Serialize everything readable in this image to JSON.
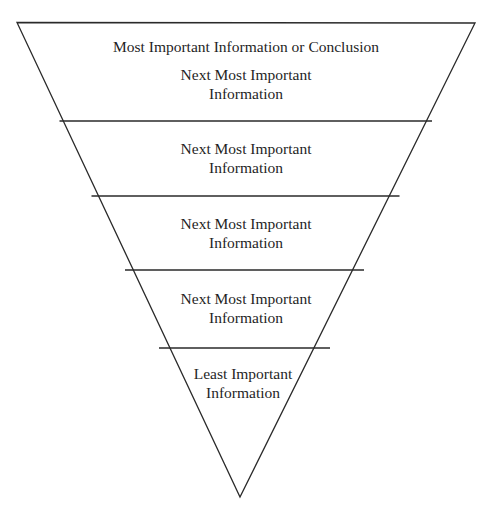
{
  "diagram": {
    "shape": "inverted-triangle",
    "stroke_color": "#2a2a2a",
    "text_color": "#1f1f1f",
    "background": "#ffffff",
    "levels": [
      {
        "rank": 1,
        "lines": [
          "Most Important Information or Conclusion",
          "Next Most Important",
          "Information"
        ]
      },
      {
        "rank": 2,
        "lines": [
          "Next Most Important",
          "Information"
        ]
      },
      {
        "rank": 3,
        "lines": [
          "Next Most Important",
          "Information"
        ]
      },
      {
        "rank": 4,
        "lines": [
          "Next Most Important",
          "Information"
        ]
      },
      {
        "rank": 5,
        "lines": [
          "Least Important",
          "Information"
        ]
      }
    ]
  }
}
